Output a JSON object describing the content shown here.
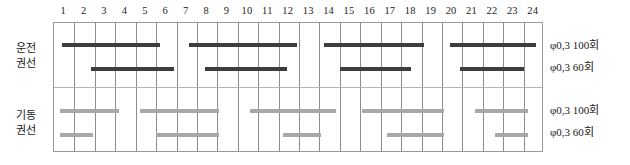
{
  "chart_data": {
    "type": "bar",
    "title": "",
    "subtitle": "",
    "xlabel": "",
    "ylabel": "",
    "grid": true,
    "orientation": "horizontal",
    "legend_position": "right",
    "x_axis": {
      "tick_labels": [
        "1",
        "2",
        "3",
        "4",
        "5",
        "6",
        "7",
        "8",
        "9",
        "10",
        "11",
        "12",
        "13",
        "14",
        "15",
        "16",
        "17",
        "18",
        "19",
        "20",
        "21",
        "22",
        "23",
        "24"
      ],
      "xlim": [
        0,
        24
      ],
      "tick_step": 1
    },
    "groups": [
      {
        "name": "운전 권선",
        "label_lines": [
          "운전",
          "권선"
        ],
        "color": "#3d3d3d",
        "series": [
          {
            "name": "φ0.3  100회",
            "color": "#3d3d3d",
            "intervals": [
              [
                0.4,
                5.2
              ],
              [
                6.6,
                11.9
              ],
              [
                13.2,
                18.1
              ],
              [
                19.4,
                23.6
              ]
            ]
          },
          {
            "name": "φ0.3  60회",
            "color": "#3d3d3d",
            "intervals": [
              [
                1.8,
                5.9
              ],
              [
                7.4,
                11.4
              ],
              [
                14.0,
                17.5
              ],
              [
                19.9,
                23.0
              ]
            ]
          }
        ]
      },
      {
        "name": "기동 권선",
        "label_lines": [
          "기동",
          "권선"
        ],
        "color": "#a8a8a8",
        "series": [
          {
            "name": "φ0.3  100회",
            "color": "#a8a8a8",
            "intervals": [
              [
                0.3,
                3.2
              ],
              [
                4.2,
                8.1
              ],
              [
                9.6,
                13.8
              ],
              [
                15.1,
                19.1
              ],
              [
                20.6,
                23.2
              ]
            ]
          },
          {
            "name": "φ0.3  60회",
            "color": "#a8a8a8",
            "intervals": [
              [
                0.3,
                1.9
              ],
              [
                5.0,
                8.1
              ],
              [
                11.2,
                13.1
              ],
              [
                16.3,
                19.1
              ],
              [
                21.6,
                23.2
              ]
            ]
          }
        ]
      }
    ],
    "legend_entries": [
      "φ0,3  100회",
      "φ0,3  60회",
      "φ0,3  100회",
      "φ0,3  60회"
    ]
  },
  "row_labels": {
    "operating": {
      "line1": "운전",
      "line2": "권선"
    },
    "starting": {
      "line1": "기동",
      "line2": "권선"
    }
  },
  "legend": {
    "operating_100": "φ0,3  100회",
    "operating_60": "φ0,3  60회",
    "starting_100": "φ0,3  100회",
    "starting_60": "φ0,3  60회"
  },
  "colors": {
    "dark_bar": "#3d3d3d",
    "light_bar": "#a8a8a8",
    "gridline": "#8d8d8d",
    "frame": "#9a9a9a",
    "divider": "#b4b4b4",
    "text": "#1a1a1a",
    "background": "#ffffff"
  }
}
